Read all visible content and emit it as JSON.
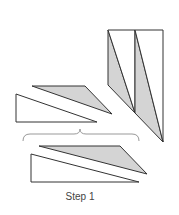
{
  "caption": "Step 1",
  "colors": {
    "stroke": "#333333",
    "shaded_fill": "#d4d4d4",
    "white_fill": "#ffffff",
    "brace": "#999999"
  },
  "shapes": {
    "vertical_strips": [
      {
        "shade": "shaded",
        "points": "108,30 108,85 135,113"
      },
      {
        "shade": "white",
        "points": "108,30 135,30 135,113"
      },
      {
        "shade": "shaded",
        "points": "135,30 163,142 135,113"
      },
      {
        "shade": "white",
        "points": "135,30 163,30 163,142"
      }
    ],
    "middle_pair": [
      {
        "shade": "shaded",
        "points": "32,86 85,86 112,114"
      },
      {
        "shade": "white",
        "points": "16,94 16,122 97,122"
      }
    ],
    "bottom_pair": [
      {
        "shade": "shaded",
        "points": "39,146 120,146 147,174"
      },
      {
        "shade": "white",
        "points": "31,154 31,182 139,182"
      }
    ]
  }
}
